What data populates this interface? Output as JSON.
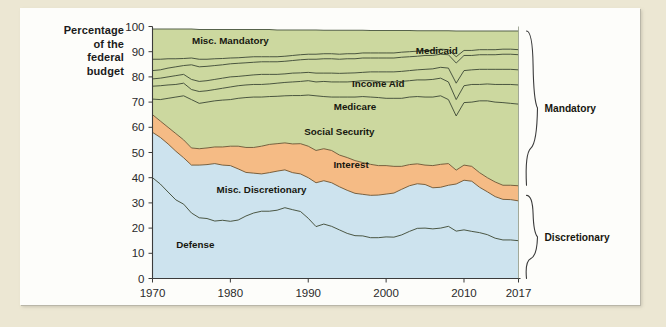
{
  "figure": {
    "background_color": "#ece7d3",
    "card_color": "#fdfdfa"
  },
  "axis_title_lines": [
    "Percentage",
    "of the",
    "federal",
    "budget"
  ],
  "braces": [
    {
      "name": "mandatory",
      "label": "Mandatory"
    },
    {
      "name": "discretionary",
      "label": "Discretionary"
    }
  ],
  "chart_data": {
    "type": "area",
    "title": "",
    "subtitle": "",
    "xlabel": "",
    "ylabel": "Percentage of the federal budget",
    "stacked": true,
    "grid": false,
    "legend_position": "inline-labels",
    "xlim": [
      1970,
      2017
    ],
    "ylim": [
      0,
      100
    ],
    "yticks": [
      0,
      10,
      20,
      30,
      40,
      50,
      60,
      70,
      80,
      90,
      100
    ],
    "xticks": [
      1970,
      1980,
      1990,
      2000,
      2010,
      2017
    ],
    "xtick_labels": [
      "1970",
      "1980",
      "1990",
      "2000",
      "2010",
      "2017"
    ],
    "ytick_labels": [
      "0",
      "10",
      "20",
      "30",
      "40",
      "50",
      "60",
      "70",
      "80",
      "90",
      "100"
    ],
    "x": [
      1970,
      1971,
      1972,
      1973,
      1974,
      1975,
      1976,
      1977,
      1978,
      1979,
      1980,
      1981,
      1982,
      1983,
      1984,
      1985,
      1986,
      1987,
      1988,
      1989,
      1990,
      1991,
      1992,
      1993,
      1994,
      1995,
      1996,
      1997,
      1998,
      1999,
      2000,
      2001,
      2002,
      2003,
      2004,
      2005,
      2006,
      2007,
      2008,
      2009,
      2010,
      2011,
      2012,
      2013,
      2014,
      2015,
      2016,
      2017
    ],
    "colors": {
      "discretionary_fill": "#cde3ee",
      "interest_fill": "#f5bb85",
      "mandatory_fill": "#ccd89f",
      "line": "#2f3a2a"
    },
    "series": [
      {
        "name": "Defense",
        "group": "Discretionary",
        "fill": "#cde3ee",
        "label": "Defense",
        "label_xy": [
          1975.5,
          12
        ],
        "values": [
          40.0,
          37.5,
          34.3,
          31.2,
          29.5,
          26.0,
          24.1,
          23.8,
          22.8,
          23.1,
          22.7,
          23.2,
          24.8,
          26.0,
          26.7,
          26.7,
          27.1,
          28.1,
          27.3,
          26.6,
          23.9,
          20.6,
          21.6,
          20.7,
          19.3,
          17.9,
          17.0,
          16.9,
          16.2,
          16.2,
          16.5,
          16.4,
          17.3,
          18.7,
          19.9,
          20.0,
          19.7,
          20.0,
          20.7,
          18.8,
          19.3,
          18.7,
          18.2,
          17.4,
          16.0,
          15.3,
          15.3,
          15.0
        ]
      },
      {
        "name": "Misc. Discretionary",
        "group": "Discretionary",
        "fill": "#cde3ee",
        "label": "Misc. Discretionary",
        "label_xy": [
          1984.0,
          34
        ],
        "values": [
          58.0,
          56.0,
          53.4,
          50.5,
          47.9,
          45.0,
          45.0,
          45.2,
          45.6,
          45.0,
          44.8,
          43.5,
          42.1,
          41.8,
          41.5,
          42.0,
          42.6,
          43.1,
          42.0,
          41.5,
          40.0,
          38.0,
          38.8,
          38.0,
          36.4,
          35.0,
          33.8,
          33.4,
          33.0,
          33.1,
          33.5,
          33.9,
          35.4,
          36.8,
          37.6,
          37.3,
          36.0,
          36.2,
          37.0,
          37.5,
          39.0,
          38.6,
          36.2,
          34.4,
          32.5,
          31.4,
          31.3,
          30.8
        ]
      },
      {
        "name": "Interest",
        "group": "Mandatory",
        "fill": "#f5bb85",
        "label": "Interest",
        "label_xy": [
          1995.5,
          44
        ],
        "values": [
          65.0,
          62.5,
          60.0,
          57.5,
          55.0,
          51.8,
          51.5,
          51.8,
          52.2,
          52.2,
          52.5,
          52.5,
          52.0,
          52.0,
          52.5,
          53.2,
          53.5,
          53.8,
          53.4,
          53.5,
          52.5,
          50.8,
          51.5,
          50.8,
          49.0,
          48.0,
          46.8,
          46.0,
          45.3,
          44.8,
          44.8,
          44.5,
          44.5,
          45.2,
          45.5,
          45.0,
          44.8,
          45.3,
          45.6,
          43.0,
          45.0,
          44.5,
          42.0,
          40.0,
          38.3,
          37.0,
          37.0,
          36.8
        ]
      },
      {
        "name": "Social Security",
        "group": "Mandatory",
        "fill": "#ccd89f",
        "label": "Social Security",
        "label_xy": [
          1994.0,
          57
        ],
        "values": [
          71.2,
          71.0,
          71.5,
          72.0,
          72.5,
          71.0,
          69.5,
          70.0,
          70.5,
          70.8,
          71.0,
          71.5,
          71.8,
          72.0,
          72.0,
          72.2,
          72.3,
          72.5,
          72.6,
          72.6,
          72.8,
          72.5,
          72.2,
          72.0,
          72.0,
          72.0,
          72.0,
          72.2,
          72.0,
          71.8,
          71.5,
          71.5,
          71.5,
          72.0,
          72.2,
          72.0,
          72.0,
          72.5,
          71.0,
          64.5,
          69.8,
          70.0,
          70.5,
          70.5,
          70.0,
          69.8,
          69.5,
          69.2
        ]
      },
      {
        "name": "Medicare",
        "group": "Mandatory",
        "fill": "#ccd89f",
        "label": "Medicare",
        "label_xy": [
          1996.0,
          67
        ],
        "values": [
          76.3,
          76.5,
          76.8,
          77.0,
          77.5,
          75.0,
          74.2,
          74.5,
          75.0,
          75.5,
          76.0,
          76.5,
          76.8,
          77.0,
          77.0,
          77.2,
          77.5,
          77.8,
          78.0,
          78.2,
          78.5,
          78.0,
          78.2,
          78.0,
          78.0,
          78.0,
          78.2,
          78.5,
          78.5,
          78.2,
          78.0,
          78.0,
          78.2,
          78.5,
          78.8,
          78.8,
          79.0,
          79.5,
          78.0,
          71.0,
          76.5,
          77.0,
          77.0,
          77.2,
          77.0,
          77.0,
          77.0,
          76.8
        ]
      },
      {
        "name": "Income Aid",
        "group": "Mandatory",
        "fill": "#ccd89f",
        "label": "Income Aid",
        "label_xy": [
          1999.0,
          76
        ],
        "values": [
          79.2,
          79.5,
          80.0,
          80.5,
          81.0,
          79.0,
          78.2,
          78.5,
          79.0,
          79.5,
          80.0,
          80.2,
          80.5,
          80.8,
          81.0,
          81.0,
          81.0,
          81.2,
          81.5,
          81.6,
          81.8,
          81.5,
          81.5,
          81.5,
          81.4,
          81.5,
          81.6,
          81.8,
          82.0,
          82.0,
          82.0,
          82.0,
          82.2,
          82.5,
          82.8,
          83.0,
          83.2,
          83.8,
          83.5,
          77.5,
          82.5,
          82.8,
          83.0,
          83.0,
          83.0,
          83.0,
          83.0,
          82.8
        ]
      },
      {
        "name": "Medicaid",
        "group": "Mandatory",
        "fill": "#ccd89f",
        "label": "Medicaid",
        "label_xy": [
          2006.5,
          89
        ],
        "values": [
          82.5,
          82.8,
          83.5,
          84.0,
          84.5,
          84.8,
          84.0,
          84.2,
          84.5,
          84.8,
          85.2,
          85.4,
          85.6,
          85.8,
          86.0,
          86.0,
          86.0,
          86.2,
          86.5,
          86.8,
          87.0,
          87.0,
          87.2,
          87.2,
          87.0,
          87.2,
          87.2,
          87.5,
          87.5,
          87.5,
          87.5,
          87.5,
          87.8,
          88.0,
          88.2,
          88.5,
          88.5,
          89.0,
          88.8,
          85.5,
          88.5,
          88.5,
          88.8,
          88.8,
          88.8,
          89.0,
          89.0,
          88.8
        ]
      },
      {
        "name": "Misc. Mandatory",
        "group": "Mandatory",
        "fill": "#ccd89f",
        "label": "Misc. Mandatory",
        "label_xy": [
          1980.0,
          93
        ],
        "values": [
          87.0,
          87.0,
          87.2,
          87.2,
          87.3,
          87.5,
          87.0,
          87.0,
          87.2,
          87.3,
          87.5,
          87.6,
          87.8,
          88.0,
          88.0,
          88.0,
          88.0,
          88.2,
          88.5,
          88.8,
          89.0,
          89.0,
          89.2,
          89.2,
          89.0,
          89.2,
          89.2,
          89.5,
          89.5,
          89.5,
          89.5,
          89.5,
          89.8,
          90.0,
          90.2,
          90.5,
          90.5,
          91.0,
          90.8,
          88.0,
          90.5,
          90.5,
          90.8,
          90.8,
          90.8,
          91.0,
          91.0,
          90.8
        ]
      },
      {
        "name": "Total",
        "group": "Top",
        "fill": "#ccd89f",
        "label": "",
        "label_xy": [
          0,
          0
        ],
        "values": [
          99.0,
          99.0,
          99.0,
          99.0,
          99.0,
          99.0,
          98.8,
          98.8,
          98.8,
          98.8,
          98.8,
          98.8,
          98.8,
          98.8,
          98.8,
          98.8,
          98.6,
          98.6,
          98.6,
          98.6,
          98.6,
          98.6,
          98.5,
          98.5,
          98.5,
          98.5,
          98.5,
          98.5,
          98.4,
          98.4,
          98.4,
          98.4,
          98.4,
          98.4,
          98.3,
          98.3,
          98.3,
          98.3,
          98.3,
          98.2,
          98.2,
          98.2,
          98.2,
          98.2,
          98.2,
          98.2,
          98.2,
          98.2
        ]
      }
    ]
  }
}
